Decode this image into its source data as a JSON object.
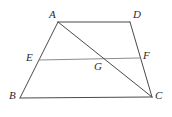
{
  "figure": {
    "kind": "geometry-diagram",
    "shape": "trapezoid",
    "background_color": "#ffffff",
    "line_color": "#4a4a4a",
    "midsegment_color": "#8c8c8c",
    "label_color": "#2b2b2b",
    "width": 172,
    "height": 117,
    "points": {
      "A": {
        "label": "A",
        "x": 58,
        "y": 22,
        "label_x": 49,
        "label_y": 9
      },
      "B": {
        "label": "B",
        "x": 20,
        "y": 98,
        "label_x": 9,
        "label_y": 90
      },
      "C": {
        "label": "C",
        "x": 152,
        "y": 97,
        "label_x": 155,
        "label_y": 90
      },
      "D": {
        "label": "D",
        "x": 130,
        "y": 22,
        "label_x": 133,
        "label_y": 9
      },
      "E": {
        "label": "E",
        "x": 39,
        "y": 60,
        "label_x": 26,
        "label_y": 52
      },
      "F": {
        "label": "F",
        "x": 140,
        "y": 58,
        "label_x": 143,
        "label_y": 50
      },
      "G": {
        "label": "G",
        "x": 101,
        "y": 60,
        "label_x": 94,
        "label_y": 61
      }
    },
    "segments": [
      {
        "name": "segment-AD",
        "from": "A",
        "to": "D",
        "style": "solid",
        "color": "#4a4a4a",
        "width": 1
      },
      {
        "name": "segment-AB",
        "from": "A",
        "to": "B",
        "style": "solid",
        "color": "#4a4a4a",
        "width": 1
      },
      {
        "name": "segment-BC",
        "from": "B",
        "to": "C",
        "style": "solid",
        "color": "#4a4a4a",
        "width": 1
      },
      {
        "name": "segment-DC",
        "from": "D",
        "to": "C",
        "style": "solid",
        "color": "#4a4a4a",
        "width": 1
      },
      {
        "name": "segment-EF",
        "from": "E",
        "to": "F",
        "style": "solid",
        "color": "#8c8c8c",
        "width": 1
      },
      {
        "name": "segment-AC",
        "from": "A",
        "to": "C",
        "style": "solid",
        "color": "#4a4a4a",
        "width": 1
      }
    ]
  }
}
